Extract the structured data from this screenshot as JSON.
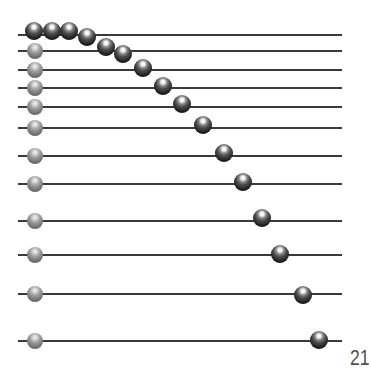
{
  "diagram": {
    "type": "bead-abacus",
    "label": "21",
    "colors": {
      "line": "#3a3a3a",
      "dark_ball": "#2e2e2e",
      "gray_ball": "#777777",
      "label": "#505050"
    },
    "line_extent": {
      "x_start": 18,
      "x_end": 342
    },
    "lines_y": [
      35,
      51,
      70,
      88,
      107,
      128,
      156,
      184,
      221,
      255,
      294,
      341
    ],
    "gray_balls": [
      {
        "x": 35,
        "y": 51
      },
      {
        "x": 35,
        "y": 70
      },
      {
        "x": 35,
        "y": 88
      },
      {
        "x": 35,
        "y": 107
      },
      {
        "x": 35,
        "y": 128
      },
      {
        "x": 35,
        "y": 156
      },
      {
        "x": 35,
        "y": 184
      },
      {
        "x": 35,
        "y": 221
      },
      {
        "x": 35,
        "y": 255
      },
      {
        "x": 35,
        "y": 294
      },
      {
        "x": 35,
        "y": 341
      }
    ],
    "dark_balls": [
      {
        "x": 34,
        "y": 31
      },
      {
        "x": 52,
        "y": 31
      },
      {
        "x": 69,
        "y": 31
      },
      {
        "x": 87,
        "y": 37
      },
      {
        "x": 106,
        "y": 47
      },
      {
        "x": 123,
        "y": 54
      },
      {
        "x": 143,
        "y": 68
      },
      {
        "x": 163,
        "y": 86
      },
      {
        "x": 182,
        "y": 104
      },
      {
        "x": 203,
        "y": 125
      },
      {
        "x": 224,
        "y": 153
      },
      {
        "x": 243,
        "y": 182
      },
      {
        "x": 262,
        "y": 218
      },
      {
        "x": 280,
        "y": 254
      },
      {
        "x": 303,
        "y": 295
      },
      {
        "x": 319,
        "y": 340
      }
    ]
  }
}
